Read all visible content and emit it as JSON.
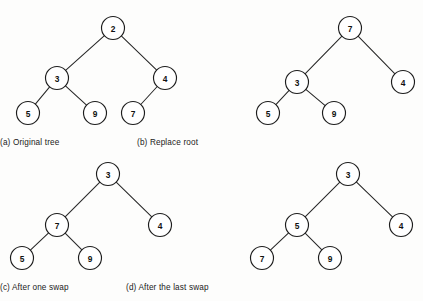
{
  "figure": {
    "background_color": "#fdfdfc",
    "node_fill": "#ffffff",
    "node_stroke": "#1d1d1d",
    "edge_color": "#272727"
  },
  "panels": [
    {
      "id": "a",
      "caption": "(a) Original tree",
      "caption_x": 110,
      "caption_y": 138,
      "origin": {
        "x": 0,
        "y": 0
      },
      "node_radius": 11.5,
      "nodes": [
        {
          "id": "a-root",
          "label": "2",
          "x": 113,
          "y": 28
        },
        {
          "id": "a-n3",
          "label": "3",
          "x": 57,
          "y": 78
        },
        {
          "id": "a-n4",
          "label": "4",
          "x": 165,
          "y": 78
        },
        {
          "id": "a-n5",
          "label": "5",
          "x": 28,
          "y": 113
        },
        {
          "id": "a-n9",
          "label": "9",
          "x": 95,
          "y": 113
        },
        {
          "id": "a-n7",
          "label": "7",
          "x": 133,
          "y": 113
        }
      ],
      "edges": [
        {
          "from": "a-root",
          "to": "a-n3"
        },
        {
          "from": "a-root",
          "to": "a-n4"
        },
        {
          "from": "a-n3",
          "to": "a-n5"
        },
        {
          "from": "a-n3",
          "to": "a-n9"
        },
        {
          "from": "a-n4",
          "to": "a-n7"
        }
      ]
    },
    {
      "id": "b",
      "caption": "(b) Replace root",
      "caption_x": 348,
      "caption_y": 138,
      "origin": {
        "x": 0,
        "y": 0
      },
      "node_radius": 11.5,
      "nodes": [
        {
          "id": "b-root",
          "label": "7",
          "x": 350,
          "y": 28
        },
        {
          "id": "b-n3",
          "label": "3",
          "x": 297,
          "y": 82
        },
        {
          "id": "b-n4",
          "label": "4",
          "x": 403,
          "y": 82
        },
        {
          "id": "b-n5",
          "label": "5",
          "x": 268,
          "y": 113
        },
        {
          "id": "b-n9",
          "label": "9",
          "x": 334,
          "y": 113
        }
      ],
      "edges": [
        {
          "from": "b-root",
          "to": "b-n3"
        },
        {
          "from": "b-root",
          "to": "b-n4"
        },
        {
          "from": "b-n3",
          "to": "b-n5"
        },
        {
          "from": "b-n3",
          "to": "b-n9"
        }
      ]
    },
    {
      "id": "c",
      "caption": "(c) After one swap",
      "caption_x": 111,
      "caption_y": 283,
      "origin": {
        "x": 0,
        "y": 0
      },
      "node_radius": 11.5,
      "nodes": [
        {
          "id": "c-root",
          "label": "3",
          "x": 108,
          "y": 174
        },
        {
          "id": "c-n7",
          "label": "7",
          "x": 57,
          "y": 225
        },
        {
          "id": "c-n4",
          "label": "4",
          "x": 160,
          "y": 225
        },
        {
          "id": "c-n5",
          "label": "5",
          "x": 22,
          "y": 258
        },
        {
          "id": "c-n9",
          "label": "9",
          "x": 90,
          "y": 258
        }
      ],
      "edges": [
        {
          "from": "c-root",
          "to": "c-n7"
        },
        {
          "from": "c-root",
          "to": "c-n4"
        },
        {
          "from": "c-n7",
          "to": "c-n5"
        },
        {
          "from": "c-n7",
          "to": "c-n9"
        }
      ]
    },
    {
      "id": "d",
      "caption": "(d) After the last swap",
      "caption_x": 337,
      "caption_y": 283,
      "origin": {
        "x": 0,
        "y": 0
      },
      "node_radius": 11.5,
      "nodes": [
        {
          "id": "d-root",
          "label": "3",
          "x": 348,
          "y": 174
        },
        {
          "id": "d-n5",
          "label": "5",
          "x": 297,
          "y": 225
        },
        {
          "id": "d-n4",
          "label": "4",
          "x": 401,
          "y": 225
        },
        {
          "id": "d-n7",
          "label": "7",
          "x": 262,
          "y": 258
        },
        {
          "id": "d-n9",
          "label": "9",
          "x": 330,
          "y": 258
        }
      ],
      "edges": [
        {
          "from": "d-root",
          "to": "d-n5"
        },
        {
          "from": "d-root",
          "to": "d-n4"
        },
        {
          "from": "d-n5",
          "to": "d-n7"
        },
        {
          "from": "d-n5",
          "to": "d-n9"
        }
      ]
    }
  ]
}
